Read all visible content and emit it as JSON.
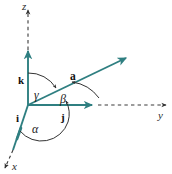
{
  "figure": {
    "kind": "3d-coordinate-axes-direction-angles",
    "background_color": "#ffffff",
    "axis_color": "#2f7f81",
    "dashed_color": "#3a3a3a",
    "arc_color": "#333333",
    "label_color": "#1a1a1a"
  },
  "axes": [
    {
      "id": "z",
      "label": "z",
      "direction": "up"
    },
    {
      "id": "y",
      "label": "y",
      "direction": "right"
    },
    {
      "id": "x",
      "label": "x",
      "direction": "lower-left"
    }
  ],
  "labels": {
    "axis_z": "z",
    "axis_y": "y",
    "axis_x": "x",
    "basis_i": "i",
    "basis_j": "j",
    "basis_k": "k",
    "vector_a": "a",
    "angle_alpha": "α",
    "angle_beta": "β",
    "angle_gamma": "γ"
  },
  "unit_vectors": [
    {
      "name": "i",
      "label": "i",
      "axis": "x"
    },
    {
      "name": "j",
      "label": "j",
      "axis": "y"
    },
    {
      "name": "k",
      "label": "k",
      "axis": "z"
    }
  ],
  "vector": {
    "name": "a",
    "label": "a"
  },
  "angles": [
    {
      "name": "alpha",
      "label": "α",
      "between": "a and i"
    },
    {
      "name": "beta",
      "label": "β",
      "between": "a and j"
    },
    {
      "name": "gamma",
      "label": "γ",
      "between": "a and k"
    }
  ]
}
